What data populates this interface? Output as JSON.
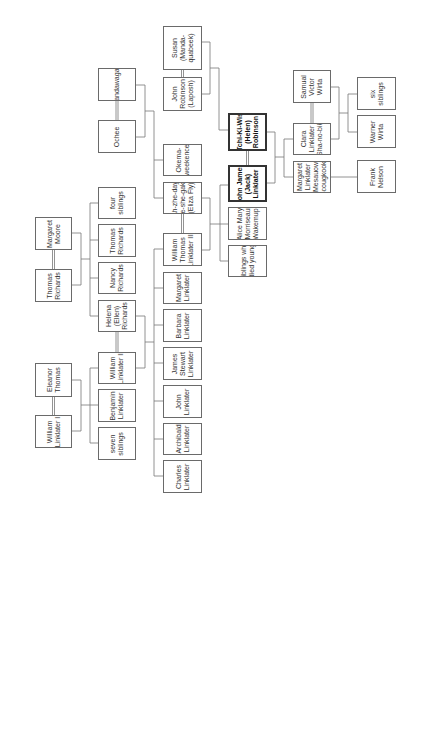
{
  "diagram": {
    "type": "family-tree",
    "orientation": "rotated-90-ccw",
    "people": [
      {
        "id": "susan",
        "label": "Susan\n(Manda-\nquabeek)",
        "x": 163,
        "y": 26,
        "w": 39,
        "h": 44
      },
      {
        "id": "john_robinson",
        "label": "John\nRobinson\n(Laposh)",
        "x": 163,
        "y": 77,
        "w": 39,
        "h": 34
      },
      {
        "id": "sandawagan",
        "label": "Sandawagan",
        "x": 98,
        "y": 68,
        "w": 38,
        "h": 33
      },
      {
        "id": "ochee",
        "label": "Ochee",
        "x": 98,
        "y": 120,
        "w": 38,
        "h": 33
      },
      {
        "id": "okema",
        "label": "Okema-\nweekence",
        "x": 163,
        "y": 144,
        "w": 39,
        "h": 32
      },
      {
        "id": "ah_zhe",
        "label": "Ah-zhe-day-\nge-she-gake\n(Eliza Fly)",
        "x": 163,
        "y": 182,
        "w": 39,
        "h": 32
      },
      {
        "id": "william_iii",
        "label": "William\nThomas\nLinklater III",
        "x": 163,
        "y": 233,
        "w": 39,
        "h": 33
      },
      {
        "id": "margaret_l",
        "label": "Margaret\nLinklater",
        "x": 163,
        "y": 272,
        "w": 39,
        "h": 32
      },
      {
        "id": "barbara",
        "label": "Barbara\nLinklater",
        "x": 163,
        "y": 309,
        "w": 39,
        "h": 33
      },
      {
        "id": "james_stewart",
        "label": "James\nStewart\nLinklater",
        "x": 163,
        "y": 347,
        "w": 39,
        "h": 33
      },
      {
        "id": "john_l",
        "label": "John\nLinklater",
        "x": 163,
        "y": 385,
        "w": 39,
        "h": 33
      },
      {
        "id": "archibald",
        "label": "Archibald\nLinklater",
        "x": 163,
        "y": 423,
        "w": 39,
        "h": 32
      },
      {
        "id": "charles",
        "label": "Charles\nLinklater",
        "x": 163,
        "y": 460,
        "w": 39,
        "h": 33
      },
      {
        "id": "tchi",
        "label": "Tchi-Ki-Wis\n(Helen)\nRobinson",
        "x": 228,
        "y": 113,
        "w": 39,
        "h": 38,
        "bold": true
      },
      {
        "id": "john_james",
        "label": "John James\n(Jack)\nLinklater",
        "x": 228,
        "y": 165,
        "w": 39,
        "h": 37,
        "bold": true
      },
      {
        "id": "alice",
        "label": "Alice Mary\nMorriseau\nWakemup",
        "x": 228,
        "y": 207,
        "w": 39,
        "h": 33
      },
      {
        "id": "siblings_died",
        "label": "siblings who\ndied young",
        "x": 228,
        "y": 245,
        "w": 39,
        "h": 32
      },
      {
        "id": "samual",
        "label": "Samual\nVictor\nWirta",
        "x": 293,
        "y": 70,
        "w": 38,
        "h": 33
      },
      {
        "id": "clara",
        "label": "Clara\nLinklater\n(Sha-no-bik)",
        "x": 293,
        "y": 123,
        "w": 38,
        "h": 32
      },
      {
        "id": "margaret_m",
        "label": "Margaret\nLinklater\n(Mesauow-\nscougkook)",
        "x": 293,
        "y": 161,
        "w": 38,
        "h": 32
      },
      {
        "id": "six_siblings",
        "label": "six\nsiblings",
        "x": 357,
        "y": 77,
        "w": 39,
        "h": 33
      },
      {
        "id": "warner",
        "label": "Warner\nWirta",
        "x": 357,
        "y": 115,
        "w": 39,
        "h": 33
      },
      {
        "id": "frank",
        "label": "Frank\nNelson",
        "x": 357,
        "y": 160,
        "w": 39,
        "h": 33
      },
      {
        "id": "margaret_moore",
        "label": "Margaret\nMoore",
        "x": 35,
        "y": 217,
        "w": 37,
        "h": 33
      },
      {
        "id": "thomas_r_sr",
        "label": "Thomas\nRichards",
        "x": 35,
        "y": 269,
        "w": 37,
        "h": 33
      },
      {
        "id": "eleanor",
        "label": "Eleanor\nThomas",
        "x": 35,
        "y": 363,
        "w": 37,
        "h": 34
      },
      {
        "id": "william_i",
        "label": "William\nLinklater I",
        "x": 35,
        "y": 415,
        "w": 37,
        "h": 33
      },
      {
        "id": "four_siblings",
        "label": "four\nsiblings",
        "x": 98,
        "y": 187,
        "w": 38,
        "h": 32
      },
      {
        "id": "thomas_r_jr",
        "label": "Thomas\nRichards",
        "x": 98,
        "y": 224,
        "w": 38,
        "h": 33
      },
      {
        "id": "nancy",
        "label": "Nancy\nRichards",
        "x": 98,
        "y": 262,
        "w": 38,
        "h": 32
      },
      {
        "id": "helena",
        "label": "Helena\n(Ellen)\nRichards",
        "x": 98,
        "y": 300,
        "w": 38,
        "h": 32
      },
      {
        "id": "william_ii",
        "label": "William\nLinklater II",
        "x": 98,
        "y": 352,
        "w": 38,
        "h": 32
      },
      {
        "id": "benjamin",
        "label": "Benjamin\nLinklater",
        "x": 98,
        "y": 389,
        "w": 38,
        "h": 33
      },
      {
        "id": "seven_siblings",
        "label": "seven\nsiblings",
        "x": 98,
        "y": 427,
        "w": 38,
        "h": 33
      }
    ],
    "marriages": [
      [
        "susan",
        "john_robinson"
      ],
      [
        "sandawagan",
        "ochee"
      ],
      [
        "ah_zhe",
        "william_iii"
      ],
      [
        "tchi",
        "john_james"
      ],
      [
        "samual",
        "clara"
      ],
      [
        "margaret_moore",
        "thomas_r_sr"
      ],
      [
        "eleanor",
        "william_i"
      ],
      [
        "helena",
        "william_ii"
      ]
    ],
    "families": [
      {
        "parents": [
          "susan",
          "john_robinson"
        ],
        "children": [
          "tchi"
        ]
      },
      {
        "parents": [
          "sandawagan",
          "ochee"
        ],
        "children": [
          "okema",
          "ah_zhe"
        ]
      },
      {
        "parents": [
          "ah_zhe",
          "william_iii"
        ],
        "children": [
          "john_james",
          "alice",
          "siblings_died"
        ]
      },
      {
        "parents": [
          "tchi",
          "john_james"
        ],
        "children": [
          "clara",
          "margaret_m"
        ]
      },
      {
        "parents": [
          "samual",
          "clara"
        ],
        "children": [
          "six_siblings",
          "warner"
        ]
      },
      {
        "parents": [
          "margaret_m"
        ],
        "children": [
          "frank"
        ]
      },
      {
        "parents": [
          "margaret_moore",
          "thomas_r_sr"
        ],
        "children": [
          "four_siblings",
          "thomas_r_jr",
          "nancy",
          "helena"
        ]
      },
      {
        "parents": [
          "eleanor",
          "william_i"
        ],
        "children": [
          "william_ii",
          "benjamin",
          "seven_siblings"
        ]
      },
      {
        "parents": [
          "helena",
          "william_ii"
        ],
        "children": [
          "william_iii",
          "margaret_l",
          "barbara",
          "james_stewart",
          "john_l",
          "archibald",
          "charles"
        ]
      }
    ]
  }
}
